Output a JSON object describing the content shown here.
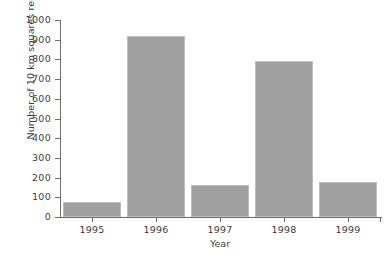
{
  "chart_data": {
    "type": "bar",
    "title": "",
    "subtitle": "",
    "xlabel": "Year",
    "ylabel": "Number of 10 km squares recorded",
    "categories": [
      "1995",
      "1996",
      "1997",
      "1998",
      "1999"
    ],
    "values": [
      78,
      918,
      160,
      793,
      180
    ],
    "series": [
      {
        "name": "Number of 10 km squares recorded",
        "values": [
          78,
          918,
          160,
          793,
          180
        ]
      }
    ],
    "ylim": [
      0,
      1000
    ],
    "ytick_labels": [
      "0",
      "100",
      "200",
      "300",
      "400",
      "500",
      "600",
      "700",
      "800",
      "900",
      "1000"
    ],
    "ytick_values": [
      0,
      100,
      200,
      300,
      400,
      500,
      600,
      700,
      800,
      900,
      1000
    ],
    "xtick_labels": [
      "1995",
      "1996",
      "1997",
      "1998",
      "1999"
    ],
    "grid": false,
    "legend": false,
    "legend_position": "none",
    "bar_color": "#a0a0a0",
    "bar_edge_color": "#bdbdbd",
    "axis_color": "#6e6e6e",
    "text_color": "#3d3d3d",
    "background_color": "#ffffff"
  }
}
